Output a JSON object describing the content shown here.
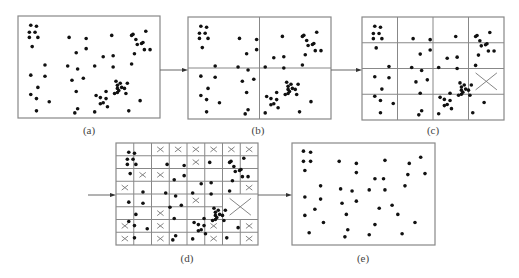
{
  "figure": {
    "panels": [
      {
        "id": "a",
        "label": "(a)",
        "box": [
          18,
          16,
          160,
          118
        ],
        "label_pos": [
          89,
          124
        ],
        "grid": null
      },
      {
        "id": "b",
        "label": "(b)",
        "box": [
          188,
          17,
          331,
          119
        ],
        "label_pos": [
          258,
          124
        ],
        "grid": {
          "cols": 2,
          "rows": 2
        }
      },
      {
        "id": "c",
        "label": "(c)",
        "box": [
          362,
          17,
          504,
          120
        ],
        "label_pos": [
          433,
          124
        ],
        "grid": {
          "cols": 4,
          "rows": 4
        },
        "eliminated": [
          [
            3,
            2
          ]
        ]
      },
      {
        "id": "d",
        "label": "(d)",
        "box": [
          116,
          143,
          258,
          245
        ],
        "label_pos": [
          187,
          252
        ],
        "grid": {
          "cols": 8,
          "rows": 8
        }
      },
      {
        "id": "e",
        "label": "(e)",
        "box": [
          292,
          143,
          435,
          245
        ],
        "label_pos": [
          363,
          252
        ],
        "grid": null
      }
    ],
    "arrows": [
      {
        "from": [
          160,
          70
        ],
        "to": [
          188,
          70
        ]
      },
      {
        "from": [
          331,
          70
        ],
        "to": [
          362,
          70
        ]
      },
      {
        "from": [
          88,
          195
        ],
        "to": [
          116,
          195
        ]
      },
      {
        "from": [
          258,
          195
        ],
        "to": [
          292,
          195
        ]
      }
    ],
    "colors": {
      "line": "#888888",
      "dot": "#111111",
      "cross": "#777777"
    }
  }
}
